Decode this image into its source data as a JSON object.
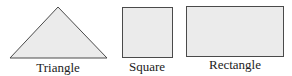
{
  "colors": {
    "fill": "#ebebeb",
    "stroke": "#4a4a4a",
    "text": "#222222"
  },
  "shapes": [
    {
      "type": "triangle",
      "label": "Triangle"
    },
    {
      "type": "square",
      "label": "Square"
    },
    {
      "type": "rectangle",
      "label": "Rectangle"
    }
  ]
}
